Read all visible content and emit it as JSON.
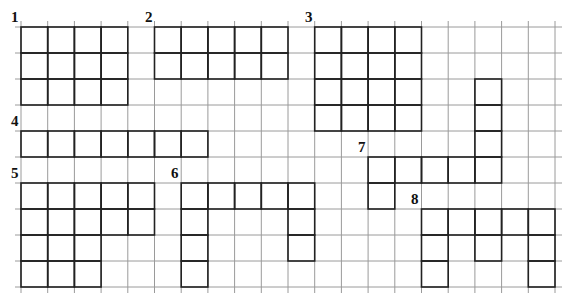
{
  "grid": {
    "origin_x": 21,
    "origin_y": 27,
    "cell_w": 26.7,
    "cell_h": 26,
    "cols": 20,
    "rows": 10,
    "extend_left": 6,
    "extend_right": 7,
    "extend_top": 6,
    "extend_bottom": 6,
    "line_color": "#9a9a9a",
    "shape_color": "#222222"
  },
  "shapes": [
    {
      "id": "1",
      "label": "1",
      "label_pos": [
        11,
        22
      ],
      "cells": [
        [
          0,
          0
        ],
        [
          1,
          0
        ],
        [
          2,
          0
        ],
        [
          3,
          0
        ],
        [
          0,
          1
        ],
        [
          1,
          1
        ],
        [
          2,
          1
        ],
        [
          3,
          1
        ],
        [
          0,
          2
        ],
        [
          1,
          2
        ],
        [
          2,
          2
        ],
        [
          3,
          2
        ]
      ]
    },
    {
      "id": "2",
      "label": "2",
      "label_pos": [
        145,
        22
      ],
      "cells": [
        [
          5,
          0
        ],
        [
          6,
          0
        ],
        [
          7,
          0
        ],
        [
          8,
          0
        ],
        [
          9,
          0
        ],
        [
          5,
          1
        ],
        [
          6,
          1
        ],
        [
          7,
          1
        ],
        [
          8,
          1
        ],
        [
          9,
          1
        ]
      ]
    },
    {
      "id": "3",
      "label": "3",
      "label_pos": [
        305,
        22
      ],
      "cells": [
        [
          11,
          0
        ],
        [
          12,
          0
        ],
        [
          13,
          0
        ],
        [
          14,
          0
        ],
        [
          11,
          1
        ],
        [
          12,
          1
        ],
        [
          13,
          1
        ],
        [
          14,
          1
        ],
        [
          11,
          2
        ],
        [
          12,
          2
        ],
        [
          13,
          2
        ],
        [
          14,
          2
        ],
        [
          11,
          3
        ],
        [
          12,
          3
        ],
        [
          13,
          3
        ],
        [
          14,
          3
        ]
      ]
    },
    {
      "id": "4",
      "label": "4",
      "label_pos": [
        11,
        126
      ],
      "cells": [
        [
          0,
          4
        ],
        [
          1,
          4
        ],
        [
          2,
          4
        ],
        [
          3,
          4
        ],
        [
          4,
          4
        ],
        [
          5,
          4
        ],
        [
          6,
          4
        ]
      ]
    },
    {
      "id": "5",
      "label": "5",
      "label_pos": [
        11,
        178
      ],
      "cells": [
        [
          0,
          6
        ],
        [
          1,
          6
        ],
        [
          2,
          6
        ],
        [
          3,
          6
        ],
        [
          4,
          6
        ],
        [
          0,
          7
        ],
        [
          1,
          7
        ],
        [
          2,
          7
        ],
        [
          3,
          7
        ],
        [
          4,
          7
        ],
        [
          0,
          8
        ],
        [
          1,
          8
        ],
        [
          2,
          8
        ],
        [
          0,
          9
        ],
        [
          1,
          9
        ],
        [
          2,
          9
        ]
      ]
    },
    {
      "id": "6",
      "label": "6",
      "label_pos": [
        171,
        178
      ],
      "cells": [
        [
          6,
          6
        ],
        [
          7,
          6
        ],
        [
          8,
          6
        ],
        [
          9,
          6
        ],
        [
          10,
          6
        ],
        [
          6,
          7
        ],
        [
          10,
          7
        ],
        [
          6,
          8
        ],
        [
          10,
          8
        ],
        [
          6,
          9
        ]
      ]
    },
    {
      "id": "7",
      "label": "7",
      "label_pos": [
        358,
        152
      ],
      "cells": [
        [
          17,
          2
        ],
        [
          17,
          3
        ],
        [
          17,
          4
        ],
        [
          13,
          5
        ],
        [
          14,
          5
        ],
        [
          15,
          5
        ],
        [
          16,
          5
        ],
        [
          17,
          5
        ],
        [
          13,
          6
        ]
      ]
    },
    {
      "id": "8",
      "label": "8",
      "label_pos": [
        411,
        204
      ],
      "cells": [
        [
          15,
          7
        ],
        [
          16,
          7
        ],
        [
          17,
          7
        ],
        [
          18,
          7
        ],
        [
          19,
          7
        ],
        [
          15,
          8
        ],
        [
          17,
          8
        ],
        [
          19,
          8
        ],
        [
          15,
          9
        ],
        [
          19,
          9
        ]
      ]
    }
  ]
}
